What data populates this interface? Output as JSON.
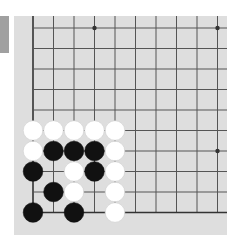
{
  "colors": {
    "board": "#dedede",
    "grid_line": "#555555",
    "edge_line": "#333333",
    "black_stone": "#111111",
    "white_stone": "#ffffff",
    "side_tab": "#a0a0a0"
  },
  "board": {
    "visible_columns": 10,
    "visible_rows": 10,
    "origin_x": 33,
    "origin_y": 28,
    "spacing": 20.5,
    "left_edge": true,
    "bottom_edge": true,
    "star_points": [
      [
        3,
        0
      ],
      [
        9,
        0
      ],
      [
        9,
        6
      ]
    ],
    "stones": [
      {
        "col": 0,
        "row": 5,
        "color": "white"
      },
      {
        "col": 1,
        "row": 5,
        "color": "white"
      },
      {
        "col": 2,
        "row": 5,
        "color": "white"
      },
      {
        "col": 3,
        "row": 5,
        "color": "white"
      },
      {
        "col": 4,
        "row": 5,
        "color": "white"
      },
      {
        "col": 0,
        "row": 6,
        "color": "white"
      },
      {
        "col": 1,
        "row": 6,
        "color": "black"
      },
      {
        "col": 2,
        "row": 6,
        "color": "black"
      },
      {
        "col": 3,
        "row": 6,
        "color": "black"
      },
      {
        "col": 4,
        "row": 6,
        "color": "white"
      },
      {
        "col": 0,
        "row": 7,
        "color": "black"
      },
      {
        "col": 2,
        "row": 7,
        "color": "white"
      },
      {
        "col": 3,
        "row": 7,
        "color": "black"
      },
      {
        "col": 4,
        "row": 7,
        "color": "white"
      },
      {
        "col": 1,
        "row": 8,
        "color": "black"
      },
      {
        "col": 2,
        "row": 8,
        "color": "white"
      },
      {
        "col": 4,
        "row": 8,
        "color": "white"
      },
      {
        "col": 0,
        "row": 9,
        "color": "black"
      },
      {
        "col": 2,
        "row": 9,
        "color": "black"
      },
      {
        "col": 4,
        "row": 9,
        "color": "white"
      }
    ]
  }
}
